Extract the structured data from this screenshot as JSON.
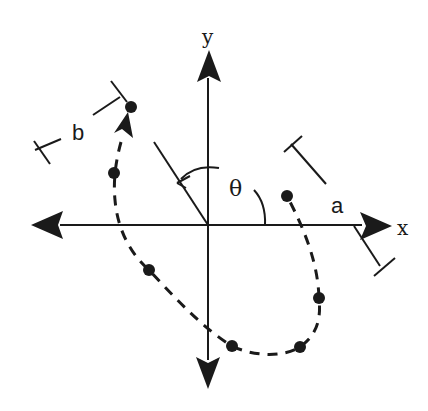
{
  "diagram": {
    "type": "coordinate-rotation-trajectory",
    "colors": {
      "ink": "#1a1a1a",
      "background": "#ffffff"
    },
    "axes": {
      "x_label": "x",
      "y_label": "y",
      "origin": [
        208,
        225
      ]
    },
    "angle": {
      "label": "θ"
    },
    "dimensions": [
      {
        "label": "a"
      },
      {
        "label": "b"
      }
    ],
    "trajectory": {
      "style": "dashed",
      "points": [
        [
          131,
          107
        ],
        [
          114,
          173
        ],
        [
          149,
          270
        ],
        [
          232,
          346
        ],
        [
          300,
          347
        ],
        [
          319,
          298
        ],
        [
          287,
          196
        ]
      ]
    }
  }
}
